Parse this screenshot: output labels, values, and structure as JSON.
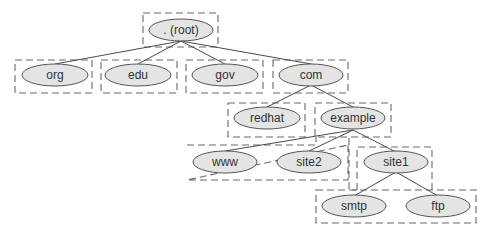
{
  "diagram": {
    "type": "dns-hierarchy-tree",
    "colors": {
      "node_fill": "#e4e4e4",
      "node_stroke": "#555555",
      "edge": "#4a4a4a",
      "zone_stroke": "#6a6a6a",
      "text": "#333333"
    },
    "nodes": {
      "root": ". (root)",
      "org": "org",
      "edu": "edu",
      "gov": "gov",
      "com": "com",
      "redhat": "redhat",
      "example": "example",
      "www": "www",
      "site2": "site2",
      "site1": "site1",
      "smtp": "smtp",
      "ftp": "ftp"
    },
    "edges": [
      [
        "root",
        "org"
      ],
      [
        "root",
        "edu"
      ],
      [
        "root",
        "gov"
      ],
      [
        "root",
        "com"
      ],
      [
        "com",
        "redhat"
      ],
      [
        "com",
        "example"
      ],
      [
        "example",
        "www"
      ],
      [
        "example",
        "site2"
      ],
      [
        "example",
        "site1"
      ],
      [
        "site1",
        "smtp"
      ],
      [
        "site1",
        "ftp"
      ]
    ],
    "zones": [
      "root",
      "org",
      "edu",
      "gov",
      "com",
      "redhat",
      "example",
      "example-hosts",
      "site1",
      "site1-hosts"
    ]
  }
}
